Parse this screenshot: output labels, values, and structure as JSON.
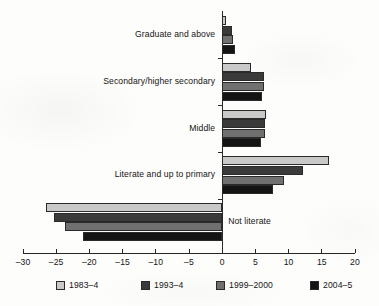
{
  "chart_data": {
    "type": "bar",
    "orientation": "horizontal",
    "title": "",
    "subtitle": "",
    "xlabel": "",
    "ylabel": "",
    "xlim": [
      -30,
      20
    ],
    "xticks": [
      -30,
      -25,
      -20,
      -15,
      -10,
      -5,
      0,
      5,
      10,
      15,
      20
    ],
    "xtick_labels": [
      "–30",
      "–25",
      "–20",
      "–15",
      "–10",
      "–5",
      "0",
      "5",
      "10",
      "15",
      "20"
    ],
    "grid": false,
    "legend_position": "bottom",
    "categories": [
      "Graduate and above",
      "Secondary/higher secondary",
      "Middle",
      "Literate and up to primary",
      "Not literate"
    ],
    "series": [
      {
        "name": "1983–4",
        "color": "#c9c9c9",
        "values": [
          0.6,
          4.4,
          6.6,
          16.1,
          -26.5
        ]
      },
      {
        "name": "1993–4",
        "color": "#3a3a3a",
        "values": [
          1.5,
          6.3,
          6.5,
          12.2,
          -25.4
        ]
      },
      {
        "name": "1999–2000",
        "color": "#707070",
        "values": [
          1.7,
          6.3,
          6.4,
          9.3,
          -23.7
        ]
      },
      {
        "name": "2004–5",
        "color": "#141414",
        "values": [
          1.9,
          6.0,
          5.8,
          7.6,
          -20.9
        ]
      }
    ]
  },
  "legend": {
    "items": [
      {
        "label": "1983–4"
      },
      {
        "label": "1993–4"
      },
      {
        "label": "1999–2000"
      },
      {
        "label": "2004–5"
      }
    ]
  },
  "axis": {
    "zero_label": "0"
  }
}
